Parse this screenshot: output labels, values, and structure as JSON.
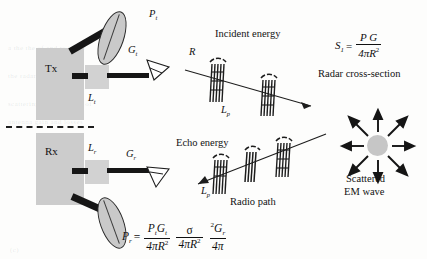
{
  "figure": {
    "blocks": {
      "transmitter": "Tx",
      "receiver": "Rx",
      "transmit_loss": "L",
      "transmit_loss_sub": "t",
      "receive_loss": "L",
      "receive_loss_sub": "r"
    },
    "antenna_labels": {
      "transmit_power": "P",
      "transmit_power_sub": "t",
      "transmit_gain": "G",
      "transmit_gain_sub": "t",
      "receive_gain": "G",
      "receive_gain_sub": "r"
    },
    "captions": {
      "incident_energy": "Incident energy",
      "echo_energy": "Echo energy",
      "radio_path": "Radio path",
      "radar_cross_section": "Radar cross-section",
      "scattered_line1": "Scattered",
      "scattered_line2": "EM wave"
    },
    "axis_labels": {
      "range": "R",
      "path_loss_upper": "L",
      "path_loss_upper_sub": "p",
      "path_loss_lower": "L",
      "path_loss_lower_sub": "p"
    },
    "equations": {
      "incident_power_density": {
        "lhs_symbol": "S",
        "lhs_sub": "1",
        "equals": "=",
        "numerator": "P G",
        "numerator_sub_1": "t",
        "numerator_sub_2": "t",
        "denominator": "4πR",
        "denominator_sup": "2"
      },
      "received_power": {
        "lhs_symbol": "P",
        "lhs_sub": "r",
        "equals": "=",
        "term1_num_p": "P",
        "term1_num_p_sub": "t",
        "term1_num_g": "G",
        "term1_num_g_sub": "t",
        "term1_den": "4πR",
        "term1_den_sup": "2",
        "term2_num": "σ",
        "term2_den": "4πR",
        "term2_den_sup": "2",
        "term3_num_sup": "2",
        "term3_num_g": "G",
        "term3_num_g_sub": "r",
        "term3_den": "4π"
      }
    },
    "ghost_text": [
      "a the the of and to in for",
      "the radar equation is derived",
      "scattering cross-section of",
      "antenna gain and losses",
      "(c)"
    ],
    "colors": {
      "ink": "#101010",
      "block_fill": "#cccccc",
      "dish_fill": "#c9c9c9",
      "target_fill": "#c6c6c6",
      "page": "#fdfdfc"
    }
  }
}
